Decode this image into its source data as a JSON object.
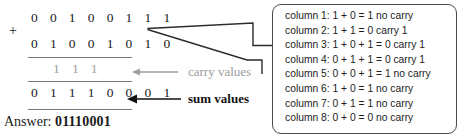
{
  "problem": {
    "operator": "+",
    "addend1": "0 0 1 0 0 1 1 1",
    "addend2": "0 1 0 0 1 0 1 0",
    "carry_row": "1 1 1",
    "sum_row": "0 1 1 1 0 0 0 1",
    "answer_label": "Answer:",
    "answer_value": "01110001"
  },
  "annotations": {
    "carry_label": "carry values",
    "sum_label": "sum values",
    "carry_color": "#9d9d9d",
    "sum_color": "#111111"
  },
  "explanation": {
    "lines": [
      "column 1: 1 + 0 = 1 no carry",
      "column 2: 1 + 1 = 0 carry 1",
      "column 3: 1 + 0 + 1 = 0 carry 1",
      "column 4: 0 + 1 + 1 = 0 carry 1",
      "column 5: 0 + 0 + 1 = 1 no carry",
      "column 6: 1 + 0  = 1 no carry",
      "column 7: 0 + 1  = 1 no carry",
      "column 8: 0 + 0  = 0 no carry"
    ]
  },
  "colors": {
    "ink": "#1a1a1a",
    "rule": "#7a7a7a",
    "box_border": "#4a4a4a",
    "gray_text": "#9d9d9d"
  }
}
